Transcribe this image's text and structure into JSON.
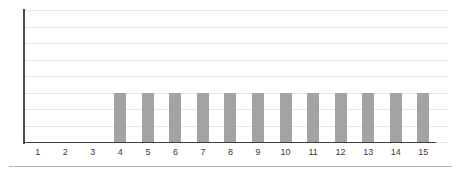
{
  "chart_data": {
    "type": "bar",
    "title": "",
    "subtitle": "",
    "xlabel": "",
    "ylabel": "",
    "categories": [
      "1",
      "2",
      "3",
      "4",
      "5",
      "6",
      "7",
      "8",
      "9",
      "10",
      "11",
      "12",
      "13",
      "14",
      "15"
    ],
    "values": [
      0,
      0,
      0,
      3,
      3,
      3,
      3,
      3,
      3,
      3,
      3,
      3,
      3,
      3,
      3
    ],
    "series": [
      {
        "name": "",
        "values": [
          0,
          0,
          0,
          3,
          3,
          3,
          3,
          3,
          3,
          3,
          3,
          3,
          3,
          3,
          3
        ]
      }
    ],
    "ylim": [
      0,
      8
    ],
    "y_gridline_values": [
      0,
      1,
      2,
      3,
      4,
      5,
      6,
      7,
      8
    ],
    "y_tick_labels": [],
    "grid": true,
    "grid_axis": "y",
    "legend": false,
    "legend_position": "none",
    "annotations": [],
    "bar_color": "#a3a3a3",
    "gridline_color": "#e6e6e6",
    "axis_color": "#3d3d3d",
    "label_color": "#3a3a3a",
    "background_color": "#ffffff"
  }
}
